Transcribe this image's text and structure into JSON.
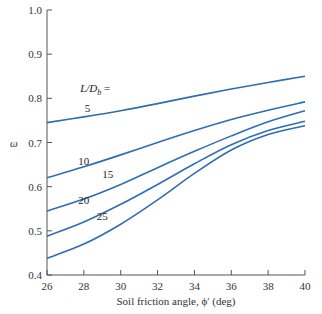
{
  "chart_data": {
    "type": "line",
    "title": "",
    "xlabel": "Soil friction angle, ϕ′ (deg)",
    "ylabel": "ω",
    "xlim": [
      26,
      40
    ],
    "ylim": [
      0.4,
      1.0
    ],
    "x_ticks": [
      26,
      28,
      30,
      32,
      34,
      36,
      38,
      40
    ],
    "x_tick_labels": [
      "26",
      "28",
      "30",
      "32",
      "34",
      "36",
      "38",
      "40"
    ],
    "y_ticks": [
      0.4,
      0.5,
      0.6,
      0.7,
      0.8,
      0.9,
      1.0
    ],
    "y_tick_labels": [
      "0.4",
      "0.5",
      "0.6",
      "0.7",
      "0.8",
      "0.9",
      "1.0"
    ],
    "grid": false,
    "legend_title": "L/D_b =",
    "x": [
      26,
      28,
      30,
      32,
      34,
      36,
      38,
      40
    ],
    "series": [
      {
        "name": "5",
        "values": [
          0.745,
          0.758,
          0.772,
          0.788,
          0.805,
          0.821,
          0.836,
          0.85
        ]
      },
      {
        "name": "10",
        "values": [
          0.62,
          0.645,
          0.672,
          0.7,
          0.727,
          0.752,
          0.773,
          0.792
        ]
      },
      {
        "name": "15",
        "values": [
          0.545,
          0.572,
          0.605,
          0.643,
          0.68,
          0.715,
          0.747,
          0.772
        ]
      },
      {
        "name": "20",
        "values": [
          0.488,
          0.52,
          0.56,
          0.605,
          0.652,
          0.695,
          0.727,
          0.748
        ]
      },
      {
        "name": "25",
        "values": [
          0.438,
          0.47,
          0.515,
          0.57,
          0.63,
          0.683,
          0.718,
          0.738
        ]
      }
    ],
    "curve_label_positions": [
      {
        "name": "5",
        "x": 28.2,
        "y": 0.77
      },
      {
        "name": "10",
        "x": 28.0,
        "y": 0.648
      },
      {
        "name": "15",
        "x": 29.3,
        "y": 0.62
      },
      {
        "name": "20",
        "x": 28.0,
        "y": 0.56
      },
      {
        "name": "25",
        "x": 29.0,
        "y": 0.525
      }
    ],
    "line_color": "#2f6db5"
  }
}
